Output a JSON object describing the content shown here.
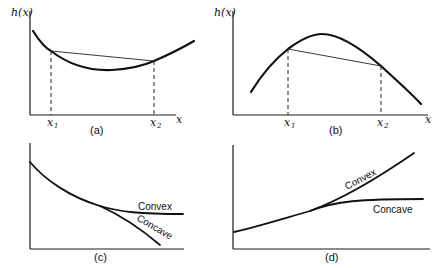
{
  "panels": {
    "a": {
      "caption": "(a)",
      "ylabel": "h(x)",
      "xlabel": "x",
      "x1_label": "x",
      "x1_sub": "1",
      "x2_label": "x",
      "x2_sub": "2",
      "description": "Convex function with chord lying above the curve between x1 and x2"
    },
    "b": {
      "caption": "(b)",
      "ylabel": "h(x)",
      "xlabel": "x",
      "x1_label": "x",
      "x1_sub": "1",
      "x2_label": "x",
      "x2_sub": "2",
      "description": "Concave function with chord lying below the curve between x1 and x2"
    },
    "c": {
      "caption": "(c)",
      "convex_label": "Convex",
      "concave_label": "Concave",
      "description": "Decreasing function branching into convex and concave continuations"
    },
    "d": {
      "caption": "(d)",
      "convex_label": "Convex",
      "concave_label": "Concave",
      "description": "Increasing function branching into convex and concave continuations"
    }
  },
  "colors": {
    "ink": "#111111",
    "background": "#ffffff"
  }
}
